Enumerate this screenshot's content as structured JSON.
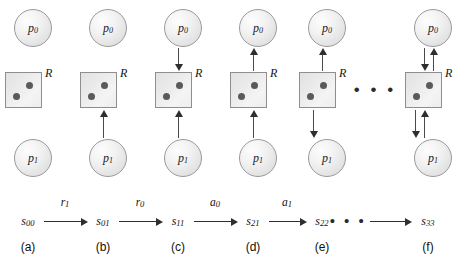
{
  "figure": {
    "resource_label": "R",
    "process_top": {
      "name": "p",
      "sub": "0"
    },
    "process_bottom": {
      "name": "p",
      "sub": "1"
    },
    "token_count": 2,
    "ellipsis": "• • •"
  },
  "panels": [
    {
      "id": "a",
      "caption": "(a)",
      "x": 28,
      "arrows": []
    },
    {
      "id": "b",
      "caption": "(b)",
      "x": 103,
      "arrows": [
        "p1-to-r"
      ]
    },
    {
      "id": "c",
      "caption": "(c)",
      "x": 178,
      "arrows": [
        "p0-to-r",
        "p1-to-r"
      ]
    },
    {
      "id": "d",
      "caption": "(d)",
      "x": 253,
      "arrows": [
        "r-to-p0",
        "p1-to-r"
      ]
    },
    {
      "id": "e",
      "caption": "(e)",
      "x": 322,
      "arrows": [
        "r-to-p0",
        "r-to-p1"
      ]
    },
    {
      "id": "f",
      "caption": "(f)",
      "x": 428,
      "arrows": [
        "p0-to-r",
        "r-to-p0",
        "r-to-p1",
        "p1-to-r"
      ]
    }
  ],
  "diagram_ellipsis_x": 375,
  "chain": {
    "states": [
      {
        "name": "s",
        "sub": "00",
        "x": 28
      },
      {
        "name": "s",
        "sub": "01",
        "x": 103
      },
      {
        "name": "s",
        "sub": "11",
        "x": 178
      },
      {
        "name": "s",
        "sub": "21",
        "x": 253
      },
      {
        "name": "s",
        "sub": "22",
        "x": 322
      },
      {
        "name": "s",
        "sub": "33",
        "x": 428
      }
    ],
    "transitions": [
      {
        "name": "r",
        "sub": "1",
        "x": 65,
        "from": 44,
        "to": 88
      },
      {
        "name": "r",
        "sub": "0",
        "x": 140,
        "from": 119,
        "to": 163
      },
      {
        "name": "a",
        "sub": "0",
        "x": 215,
        "from": 194,
        "to": 238
      },
      {
        "name": "a",
        "sub": "1",
        "x": 287,
        "from": 269,
        "to": 307
      },
      {
        "name": "",
        "sub": "",
        "x": 395,
        "from": 370,
        "to": 412
      }
    ],
    "ellipsis": "• • •",
    "ellipsis_x": 348
  }
}
